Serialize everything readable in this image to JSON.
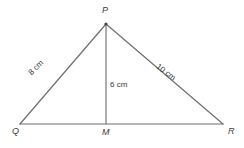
{
  "figure": {
    "type": "triangle-with-altitude",
    "background_color": "#ffffff",
    "stroke_color": "#6e6e6e",
    "text_color": "#3a3a3a",
    "vertices": [
      {
        "name": "P",
        "label": "P",
        "x": 106,
        "y": 24,
        "label_x": 102,
        "label_y": 6
      },
      {
        "name": "Q",
        "label": "Q",
        "x": 20,
        "y": 124,
        "label_x": 12,
        "label_y": 127
      },
      {
        "name": "M",
        "label": "M",
        "x": 106,
        "y": 124,
        "label_x": 102,
        "label_y": 128
      },
      {
        "name": "R",
        "label": "R",
        "x": 223,
        "y": 124,
        "label_x": 228,
        "label_y": 127
      }
    ],
    "segments": [
      {
        "name": "side-pq",
        "from": "Q",
        "to": "P",
        "measure": "8 cm"
      },
      {
        "name": "side-pr",
        "from": "P",
        "to": "R",
        "measure": "10 cm"
      },
      {
        "name": "base-qr",
        "from": "Q",
        "to": "R",
        "measure": ""
      },
      {
        "name": "altitude-pm",
        "from": "P",
        "to": "M",
        "measure": "6 cm"
      }
    ],
    "labels": {
      "side_pq": "8 cm",
      "side_pr": "10 cm",
      "altitude_pm": "6 cm",
      "vertex_p": "P",
      "vertex_q": "Q",
      "vertex_m": "M",
      "vertex_r": "R"
    }
  }
}
